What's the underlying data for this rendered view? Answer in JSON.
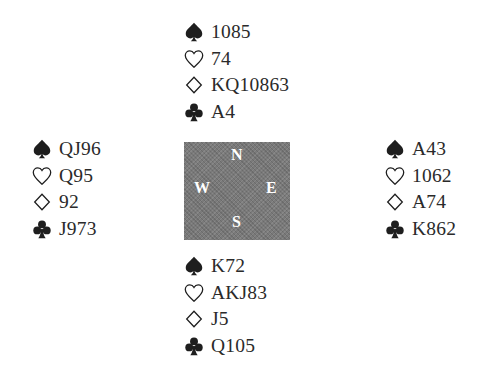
{
  "hands": {
    "north": {
      "label": "N",
      "spades": "1085",
      "hearts": "74",
      "diamonds": "KQ10863",
      "clubs": "A4"
    },
    "west": {
      "label": "W",
      "spades": "QJ96",
      "hearts": "Q95",
      "diamonds": "92",
      "clubs": "J973"
    },
    "east": {
      "label": "E",
      "spades": "A43",
      "hearts": "1062",
      "diamonds": "A74",
      "clubs": "K862"
    },
    "south": {
      "label": "S",
      "spades": "K72",
      "hearts": "AKJ83",
      "diamonds": "J5",
      "clubs": "Q105"
    }
  },
  "suit_icons": {
    "spades": "spade-icon",
    "hearts": "heart-outline-icon",
    "diamonds": "diamond-outline-icon",
    "clubs": "club-icon"
  },
  "colors": {
    "text": "#2a2a2a",
    "compass_bg": "#7a7a7a",
    "compass_text": "#ffffff"
  }
}
